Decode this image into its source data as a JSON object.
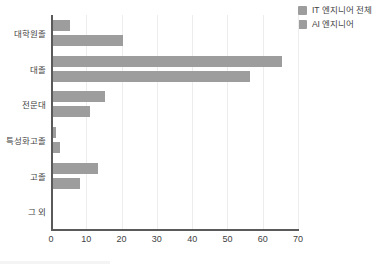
{
  "chart_data": {
    "type": "bar",
    "orientation": "horizontal",
    "title": "",
    "xlabel": "",
    "ylabel": "",
    "xlim": [
      0,
      70
    ],
    "xticks": [
      0,
      10,
      20,
      30,
      40,
      50,
      60,
      70
    ],
    "grid": true,
    "legend_position": "top-right",
    "categories": [
      "대학원졸",
      "대졸",
      "전문대",
      "특성화고졸",
      "고졸",
      "그 외"
    ],
    "series": [
      {
        "name": "IT 엔지니어 전체",
        "color": "#9d9d9d",
        "values": [
          5.4,
          65.4,
          15.3,
          1.4,
          13.3,
          0.5
        ]
      },
      {
        "name": "AI 엔지니어",
        "color": "#9d9d9d",
        "values": [
          20.5,
          56.3,
          11.0,
          2.6,
          8.2,
          0.4
        ]
      }
    ]
  },
  "axis": {
    "tick_labels": [
      "0",
      "10",
      "20",
      "30",
      "40",
      "50",
      "60",
      "70"
    ]
  },
  "legend": {
    "items": [
      {
        "label": "IT 엔지니어 전체",
        "color": "#9d9d9d"
      },
      {
        "label": "AI 엔지니어",
        "color": "#9d9d9d"
      }
    ]
  },
  "colors": {
    "axis": "#5a5a5a",
    "grid": "#ededed",
    "text": "#3f3f3f",
    "background": "#ffffff"
  }
}
